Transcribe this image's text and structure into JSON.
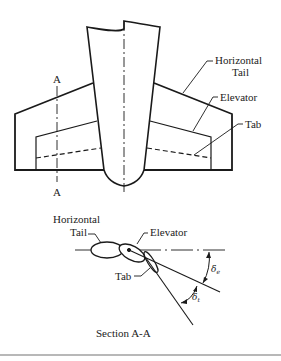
{
  "diagram": {
    "top_view": {
      "labels": {
        "horizontal_tail_line1": "Horizontal",
        "horizontal_tail_line2": "Tail",
        "elevator": "Elevator",
        "tab": "Tab",
        "section_mark_top": "A",
        "section_mark_bottom": "A"
      }
    },
    "section_view": {
      "labels": {
        "horizontal_tail_line1": "Horizontal",
        "horizontal_tail_line2": "Tail",
        "elevator": "Elevator",
        "tab": "Tab",
        "delta_e": "δ",
        "delta_e_sub": "e",
        "delta_t": "δ",
        "delta_t_sub": "t"
      },
      "caption": "Section A-A"
    },
    "colors": {
      "line": "#1a1a1a",
      "background": "#ffffff",
      "rule": "#b8b8b8"
    }
  }
}
